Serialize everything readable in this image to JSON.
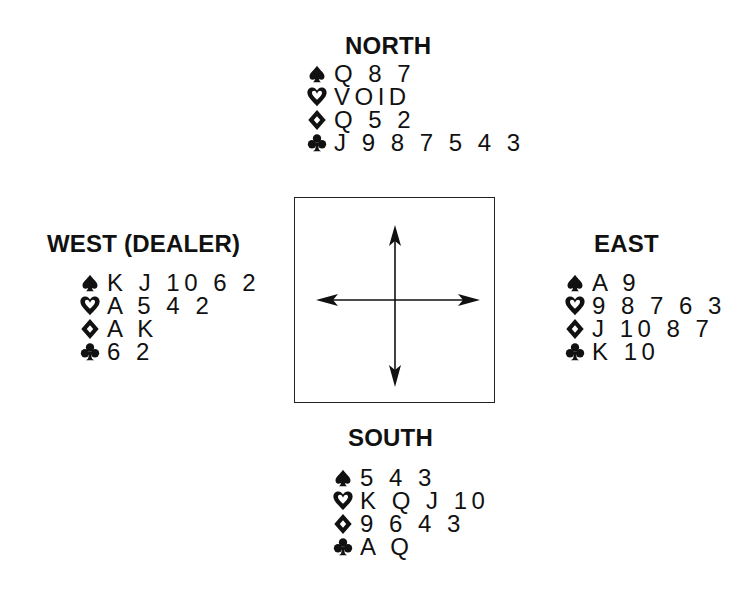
{
  "diagram": {
    "type": "bridge-deal",
    "ink_color": "#111111",
    "background": "#ffffff"
  },
  "north": {
    "title": "NORTH",
    "spades": "Q 8 7",
    "hearts": "VOID",
    "diamonds": "Q 5 2",
    "clubs": "J 9 8 7 5 4 3"
  },
  "west": {
    "title": "WEST (DEALER)",
    "spades": "K J 10 6 2",
    "hearts": "A 5 4 2",
    "diamonds": "A K",
    "clubs": "6 2"
  },
  "east": {
    "title": "EAST",
    "spades": "A 9",
    "hearts": "9 8 7 6 3",
    "diamonds": "J 10 8 7",
    "clubs": "K 10"
  },
  "south": {
    "title": "SOUTH",
    "spades": "5 4 3",
    "hearts": "K Q J 10",
    "diamonds": "9 6 4 3",
    "clubs": "A Q"
  },
  "icons": {
    "spades": "spade-icon",
    "hearts": "heart-icon",
    "diamonds": "diamond-icon",
    "clubs": "club-icon",
    "center": "compass-arrows-icon"
  }
}
